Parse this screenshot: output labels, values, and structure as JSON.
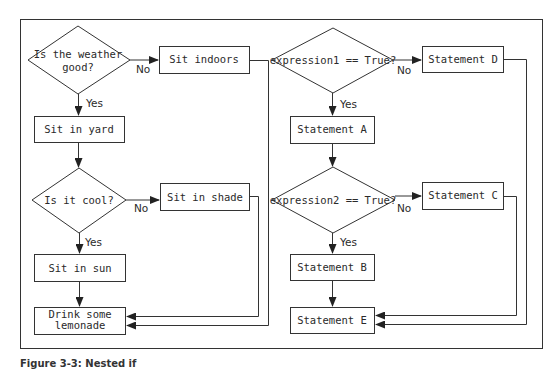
{
  "left_flow": {
    "decision1": {
      "line1": "Is the weather",
      "line2": "good?"
    },
    "no1_label": "No",
    "sit_indoors": "Sit indoors",
    "yes1_label": "Yes",
    "sit_in_yard": "Sit in yard",
    "decision2": {
      "line1": "Is it cool?"
    },
    "no2_label": "No",
    "sit_in_shade": "Sit in shade",
    "yes2_label": "Yes",
    "sit_in_sun": "Sit in sun",
    "drink": {
      "line1": "Drink some",
      "line2": "lemonade"
    }
  },
  "right_flow": {
    "decision1": "expression1 == True?",
    "no1_label": "No",
    "statement_d": "Statement D",
    "yes1_label": "Yes",
    "statement_a": "Statement A",
    "decision2": "expression2 == True?",
    "no2_label": "No",
    "statement_c": "Statement C",
    "yes2_label": "Yes",
    "statement_b": "Statement B",
    "statement_e": "Statement E"
  },
  "caption": "Figure 3-3: Nested if"
}
